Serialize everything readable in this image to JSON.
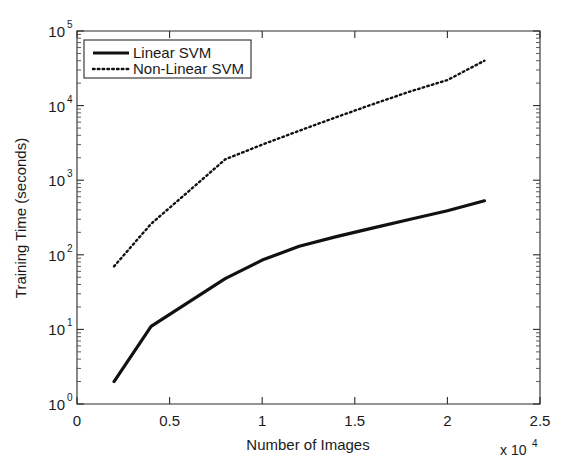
{
  "chart_data": {
    "type": "line",
    "title": "",
    "xlabel": "Number of Images",
    "ylabel": "Training Time (seconds)",
    "x_multiplier": "x 10",
    "x_multiplier_exp": "4",
    "xlim": [
      0,
      2.5
    ],
    "ylim": [
      1,
      100000
    ],
    "yscale": "log",
    "xscale": "linear",
    "grid": false,
    "legend_position": "top-left inside",
    "x_ticks": [
      "0",
      "0.5",
      "1",
      "1.5",
      "2",
      "2.5"
    ],
    "x_tick_values": [
      0,
      0.5,
      1,
      1.5,
      2,
      2.5
    ],
    "y_ticks": [
      "10",
      "10",
      "10",
      "10",
      "10",
      "10"
    ],
    "y_tick_exponents": [
      "0",
      "1",
      "2",
      "3",
      "4",
      "5"
    ],
    "y_tick_values": [
      1,
      10,
      100,
      1000,
      10000,
      100000
    ],
    "series": [
      {
        "name": "Linear SVM",
        "style": "solid",
        "color": "#111111",
        "x": [
          0.2,
          0.4,
          0.8,
          1.0,
          1.2,
          1.4,
          1.6,
          1.8,
          2.0,
          2.2
        ],
        "y": [
          2,
          11,
          48,
          85,
          130,
          175,
          230,
          300,
          390,
          530
        ]
      },
      {
        "name": "Non-Linear SVM",
        "style": "dotted",
        "color": "#111111",
        "x": [
          0.2,
          0.4,
          0.6,
          0.8,
          1.0,
          1.2,
          1.4,
          1.6,
          1.8,
          2.0,
          2.2
        ],
        "y": [
          70,
          260,
          700,
          1900,
          3000,
          4600,
          7000,
          10500,
          15500,
          22000,
          40000
        ]
      }
    ]
  },
  "legend": {
    "items": [
      {
        "label": "Linear SVM",
        "style": "solid"
      },
      {
        "label": "Non-Linear SVM",
        "style": "dotted"
      }
    ]
  }
}
